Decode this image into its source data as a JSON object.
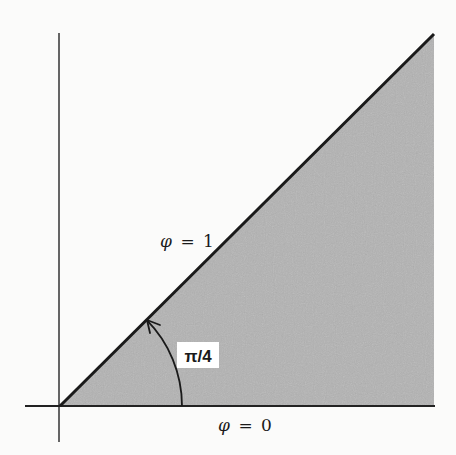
{
  "diagram": {
    "title": "",
    "colors": {
      "background": "#fbfbfa",
      "region_fill": "#b3b3b3",
      "lines": "#1a1a1a",
      "label_box": "#ffffff"
    },
    "geometry": {
      "origin": [
        60,
        406
      ],
      "x_axis": {
        "from": [
          25,
          406
        ],
        "to": [
          435,
          406
        ]
      },
      "y_axis": {
        "from": [
          59,
          33
        ],
        "to": [
          59,
          442
        ]
      },
      "diagonal": {
        "from": [
          60,
          406
        ],
        "to": [
          434,
          34
        ]
      },
      "right_edge_x": 434,
      "arc": {
        "center": [
          60,
          406
        ],
        "radius": 122,
        "start_deg": 0,
        "end_deg": 45
      }
    },
    "labels": {
      "upper_boundary": {
        "symbol": "φ",
        "equals": "=",
        "value": "1",
        "text": "φ = 1"
      },
      "lower_boundary": {
        "symbol": "φ",
        "equals": "=",
        "value": "0",
        "text": "φ = 0"
      },
      "angle": "π/4"
    }
  }
}
